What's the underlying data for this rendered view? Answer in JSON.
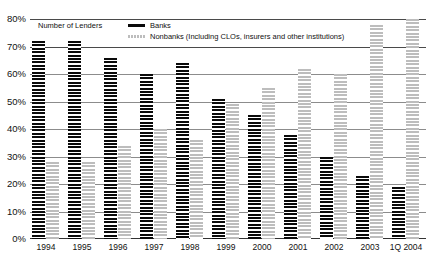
{
  "chart_data": {
    "type": "bar",
    "title": "",
    "subtitle": "",
    "xlabel": "",
    "ylabel": "",
    "legend_title": "Number of Lenders",
    "legend_position": "top-left",
    "grid": true,
    "ylim": [
      0,
      80
    ],
    "ytick_labels": [
      "80%",
      "70%",
      "60%",
      "50%",
      "40%",
      "30%",
      "20%",
      "10%",
      "0%"
    ],
    "ytick_values": [
      80,
      70,
      60,
      50,
      40,
      30,
      20,
      10,
      0
    ],
    "categories": [
      "1994",
      "1995",
      "1996",
      "1997",
      "1998",
      "1999",
      "2000",
      "2001",
      "2002",
      "2003",
      "1Q 2004"
    ],
    "series": [
      {
        "name": "Banks",
        "color": "#0a0a0a",
        "values": [
          72,
          72,
          66,
          60,
          64,
          51,
          45,
          38,
          30,
          23,
          19
        ]
      },
      {
        "name": "Nonbanks (Including CLOs, insurers and other institutions)",
        "color": "#bdbdbd",
        "values": [
          28,
          28,
          34,
          40,
          36,
          49,
          55,
          62,
          60,
          78,
          80
        ]
      }
    ]
  },
  "legend": {
    "title": "Number of Lenders",
    "entries": [
      {
        "label": "Banks",
        "swatch": "banks-swatch"
      },
      {
        "label": "Nonbanks (Including CLOs, insurers and other institutions)",
        "swatch": "nonbanks-swatch"
      }
    ]
  }
}
